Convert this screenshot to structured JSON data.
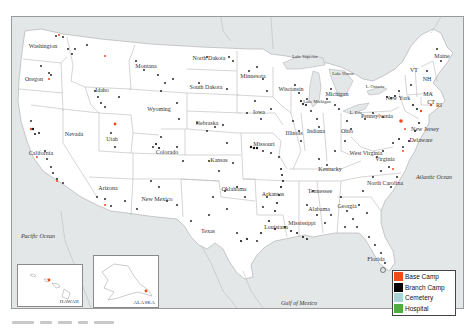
{
  "map": {
    "states": [
      {
        "name": "Washington",
        "x": 42,
        "y": 45
      },
      {
        "name": "Oregon",
        "x": 33,
        "y": 78
      },
      {
        "name": "California",
        "x": 40,
        "y": 152
      },
      {
        "name": "Nevada",
        "x": 73,
        "y": 133
      },
      {
        "name": "Idaho",
        "x": 101,
        "y": 89
      },
      {
        "name": "Montana",
        "x": 145,
        "y": 65
      },
      {
        "name": "Wyoming",
        "x": 158,
        "y": 108
      },
      {
        "name": "Utah",
        "x": 111,
        "y": 138
      },
      {
        "name": "Arizona",
        "x": 107,
        "y": 187
      },
      {
        "name": "Colorado",
        "x": 166,
        "y": 151
      },
      {
        "name": "New Mexico",
        "x": 156,
        "y": 198
      },
      {
        "name": "North Dakota",
        "x": 208,
        "y": 57
      },
      {
        "name": "South Dakota",
        "x": 205,
        "y": 86
      },
      {
        "name": "Nebraska",
        "x": 206,
        "y": 122
      },
      {
        "name": "Kansas",
        "x": 218,
        "y": 159
      },
      {
        "name": "Oklahoma",
        "x": 233,
        "y": 188
      },
      {
        "name": "Texas",
        "x": 207,
        "y": 230
      },
      {
        "name": "Minnesota",
        "x": 252,
        "y": 75
      },
      {
        "name": "Iowa",
        "x": 258,
        "y": 111
      },
      {
        "name": "Missouri",
        "x": 263,
        "y": 143
      },
      {
        "name": "Arkansas",
        "x": 272,
        "y": 193
      },
      {
        "name": "Louisiana",
        "x": 275,
        "y": 226
      },
      {
        "name": "Wisconsin",
        "x": 290,
        "y": 88
      },
      {
        "name": "Illinois",
        "x": 293,
        "y": 132
      },
      {
        "name": "Mississippi",
        "x": 301,
        "y": 222
      },
      {
        "name": "Michigan",
        "x": 336,
        "y": 93
      },
      {
        "name": "Indiana",
        "x": 315,
        "y": 130
      },
      {
        "name": "Kentucky",
        "x": 329,
        "y": 168
      },
      {
        "name": "Tennessee",
        "x": 319,
        "y": 190
      },
      {
        "name": "Alabama",
        "x": 318,
        "y": 208
      },
      {
        "name": "Ohio",
        "x": 346,
        "y": 130
      },
      {
        "name": "Georgia",
        "x": 346,
        "y": 205
      },
      {
        "name": "Florida",
        "x": 375,
        "y": 258
      },
      {
        "name": "West Virginia",
        "x": 365,
        "y": 152
      },
      {
        "name": "Virginia",
        "x": 384,
        "y": 158
      },
      {
        "name": "North Carolina",
        "x": 384,
        "y": 182
      },
      {
        "name": "Pennsylvania",
        "x": 376,
        "y": 115
      },
      {
        "name": "New York",
        "x": 397,
        "y": 97
      },
      {
        "name": "New Jersey",
        "x": 424,
        "y": 128
      },
      {
        "name": "Delaware",
        "x": 420,
        "y": 139
      },
      {
        "name": "Maine",
        "x": 441,
        "y": 55
      },
      {
        "name": "VT",
        "x": 413,
        "y": 69
      },
      {
        "name": "NH",
        "x": 426,
        "y": 78
      },
      {
        "name": "MA",
        "x": 427,
        "y": 93
      },
      {
        "name": "CT",
        "x": 430,
        "y": 101
      },
      {
        "name": "RI",
        "x": 438,
        "y": 104
      }
    ],
    "lakes": [
      {
        "name": "Lake Superior",
        "x": 304,
        "y": 55
      },
      {
        "name": "Lake Huron",
        "x": 342,
        "y": 72
      },
      {
        "name": "L. Ontario",
        "x": 374,
        "y": 85
      },
      {
        "name": "L. Erie",
        "x": 355,
        "y": 111
      },
      {
        "name": "Lake Michigan",
        "x": 316,
        "y": 100
      }
    ],
    "oceans": [
      {
        "name": "Pacific Ocean",
        "x": 37,
        "y": 235
      },
      {
        "name": "Atlantic Ocean",
        "x": 433,
        "y": 176
      },
      {
        "name": "Gulf of Mexico",
        "x": 298,
        "y": 302
      }
    ],
    "insets": {
      "hawaii": {
        "label": "HAWAII"
      },
      "alaska": {
        "label": "ALASKA"
      }
    }
  },
  "legend": {
    "items": [
      {
        "label": "Base Camp",
        "color": "#f04a1c"
      },
      {
        "label": "Branch Camp",
        "color": "#000000"
      },
      {
        "label": "Cemetery",
        "color": "#a8d4d4"
      },
      {
        "label": "Hospital",
        "color": "#4caf3c"
      }
    ]
  },
  "colors": {
    "water": "#e4e7e8",
    "land": "#ffffff",
    "border": "#b8b8b8",
    "branch_dot": "#111111",
    "base_dot": "#f04a1c"
  }
}
